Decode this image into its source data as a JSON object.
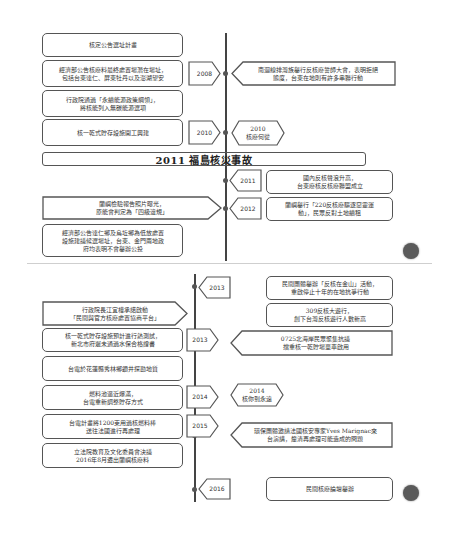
{
  "diagram": {
    "type": "timeline",
    "top_panel": {
      "left_events": [
        {
          "text": "核定公告選址計畫"
        },
        {
          "text": "經濟部公告核廢料最終處置場潛在場址，\n包括台東達仁、屏東牡丹以及澎湖望安"
        },
        {
          "text": "行政院通過「永續能源政策綱領」，\n將核能列入無碳能源選項"
        },
        {
          "text": "核一乾式貯存設施開工興建"
        },
        {
          "text": "蘭嶼檢驗報告照片曝光，\n原能會判定為「四級違規」"
        },
        {
          "text": "經濟部公告達仁鄉及烏坵鄉為低放處置\n設施建議候選場址，台東、金門兩地政\n府均表明不會舉辦公投"
        }
      ],
      "left_year_tags": [
        "2008",
        "2010"
      ],
      "right_events": [
        {
          "text": "南迴線排灣族舉行反核廢誓師大會，表明拒絕\n態度，台東在地則有許多串聯行動"
        },
        {
          "text": "2010\n核廢何從",
          "shape": "hexagon"
        },
        {
          "text": "國內反核聲浪升高，\n台東廢核反核廢聯盟成立"
        },
        {
          "text": "蘭嶼舉行「220反核廢驅逐惡靈運\n動」，民眾反對土地續租"
        }
      ],
      "right_year_tags": [
        "2011",
        "2012"
      ],
      "banner": "2011 福島核災事故"
    },
    "bottom_panel": {
      "right_events": [
        {
          "text": "民間團體舉辦「反核在金山」活動，\n重啟停止十年的在地抗爭行動"
        },
        {
          "text": "309反核大遊行，\n創下台灣反核遊行人數新高"
        },
        {
          "text": "0725北海岸民眾聚集抗議\n擋重核一乾貯場單車啟用"
        },
        {
          "text": "2014\n核你到永遠",
          "shape": "hexagon"
        },
        {
          "text": "環保團體邀請法國核安專家Yves Marignac來\n台演講，釐清再處理可能造成的問題"
        },
        {
          "text": "民間核廢論壇舉辦"
        }
      ],
      "right_year_tags": [
        "2013",
        "2016"
      ],
      "left_events": [
        {
          "text": "行政院長江宜樺承諾啟動\n「民間與官方核廢處置協商平台」"
        },
        {
          "text": "核一乾式貯存設施預計進行熱測試，\n新北市府遲未通過水保合格證書"
        },
        {
          "text": "台電於花蓮縣秀林鄉鑽井探勘地質"
        },
        {
          "text": "燃料池逼近爆滿，\n台電重新調整貯存方式"
        },
        {
          "text": "台電計畫將1200束用過核燃料棒\n送往法國進行再處理"
        },
        {
          "text": "立法院教育及文化委員會決議\n2016年8月遷出蘭嶼核廢料"
        }
      ],
      "left_year_tags": [
        "2013",
        "2014",
        "2015"
      ]
    },
    "colors": {
      "line": "#444444",
      "border": "#555555",
      "text": "#333333",
      "circle": "#5a5a5a",
      "background": "#ffffff"
    }
  }
}
